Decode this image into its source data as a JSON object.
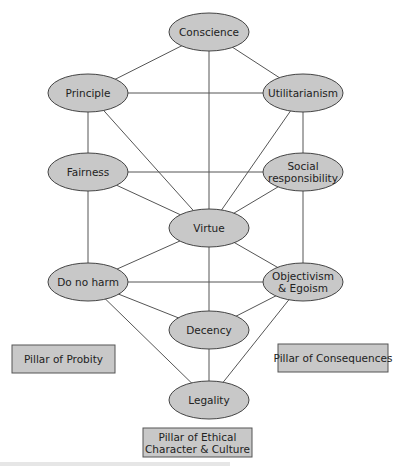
{
  "diagram": {
    "type": "network",
    "nodes": [
      {
        "id": "conscience",
        "label": "Conscience",
        "lines": [
          "Conscience"
        ],
        "cx": 209,
        "cy": 32
      },
      {
        "id": "principle",
        "label": "Principle",
        "lines": [
          "Principle"
        ],
        "cx": 88,
        "cy": 93
      },
      {
        "id": "utilitarianism",
        "label": "Utilitarianism",
        "lines": [
          "Utilitarianism"
        ],
        "cx": 303,
        "cy": 93
      },
      {
        "id": "fairness",
        "label": "Fairness",
        "lines": [
          "Fairness"
        ],
        "cx": 88,
        "cy": 172
      },
      {
        "id": "social-responsibility",
        "label": "Social responsibility",
        "lines": [
          "Social",
          "responsibility"
        ],
        "cx": 303,
        "cy": 172
      },
      {
        "id": "virtue",
        "label": "Virtue",
        "lines": [
          "Virtue"
        ],
        "cx": 209,
        "cy": 228
      },
      {
        "id": "do-no-harm",
        "label": "Do no harm",
        "lines": [
          "Do no harm"
        ],
        "cx": 88,
        "cy": 282
      },
      {
        "id": "objectivism-egoism",
        "label": "Objectivism & Egoism",
        "lines": [
          "Objectivism",
          "& Egoism"
        ],
        "cx": 303,
        "cy": 282
      },
      {
        "id": "decency",
        "label": "Decency",
        "lines": [
          "Decency"
        ],
        "cx": 209,
        "cy": 330
      },
      {
        "id": "legality",
        "label": "Legality",
        "lines": [
          "Legality"
        ],
        "cx": 209,
        "cy": 400
      }
    ],
    "edges": [
      [
        "conscience",
        "principle"
      ],
      [
        "conscience",
        "utilitarianism"
      ],
      [
        "conscience",
        "virtue"
      ],
      [
        "principle",
        "utilitarianism"
      ],
      [
        "principle",
        "fairness"
      ],
      [
        "principle",
        "virtue"
      ],
      [
        "utilitarianism",
        "social-responsibility"
      ],
      [
        "utilitarianism",
        "virtue"
      ],
      [
        "fairness",
        "social-responsibility"
      ],
      [
        "fairness",
        "virtue"
      ],
      [
        "fairness",
        "do-no-harm"
      ],
      [
        "social-responsibility",
        "virtue"
      ],
      [
        "social-responsibility",
        "objectivism-egoism"
      ],
      [
        "virtue",
        "do-no-harm"
      ],
      [
        "virtue",
        "objectivism-egoism"
      ],
      [
        "virtue",
        "decency"
      ],
      [
        "do-no-harm",
        "objectivism-egoism"
      ],
      [
        "do-no-harm",
        "decency"
      ],
      [
        "do-no-harm",
        "legality"
      ],
      [
        "objectivism-egoism",
        "decency"
      ],
      [
        "objectivism-egoism",
        "legality"
      ],
      [
        "decency",
        "legality"
      ]
    ],
    "pillars": [
      {
        "id": "probity",
        "label": "Pillar of Probity",
        "lines": [
          "Pillar of Probity"
        ],
        "x": 12,
        "y": 345,
        "w": 103,
        "h": 28
      },
      {
        "id": "consequences",
        "label": "Pillar of Consequences",
        "lines": [
          "Pillar of Consequences"
        ],
        "x": 278,
        "y": 344,
        "w": 110,
        "h": 28
      },
      {
        "id": "ethical-character",
        "label": "Pillar of Ethical Character & Culture",
        "lines": [
          "Pillar of Ethical",
          "Character & Culture"
        ],
        "x": 143,
        "y": 428,
        "w": 109,
        "h": 29
      }
    ],
    "colors": {
      "node_fill": "#c8c8c8",
      "node_stroke": "#444444",
      "edge": "#555555",
      "text": "#222222",
      "background": "#ffffff"
    }
  }
}
